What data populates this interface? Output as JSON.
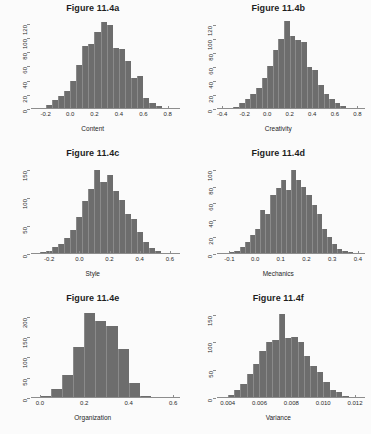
{
  "figure": {
    "background_color": "#fbfbfb",
    "bar_color": "#6d6d6d",
    "axis_color": "#8d8d8d",
    "layout": "2 columns x 3 rows grid of histograms"
  },
  "chart_data": [
    {
      "type": "bar",
      "title": "Figure 11.4a",
      "xlabel": "Content",
      "ylabel": "",
      "xticks": [
        "-0.2",
        "0.0",
        "0.2",
        "0.4",
        "0.6",
        "0.8"
      ],
      "xtick_values": [
        -0.2,
        0.0,
        0.2,
        0.4,
        0.6,
        0.8
      ],
      "yticks": [
        "0",
        "20",
        "40",
        "60",
        "80",
        "100",
        "120"
      ],
      "ytick_values": [
        0,
        20,
        40,
        60,
        80,
        100,
        120
      ],
      "xlim": [
        -0.32,
        0.88
      ],
      "ylim": [
        0,
        128
      ],
      "grid": false,
      "legend": "none",
      "bin_width": 0.05,
      "bin_starts": [
        -0.3,
        -0.25,
        -0.2,
        -0.15,
        -0.1,
        -0.05,
        0.0,
        0.05,
        0.1,
        0.15,
        0.2,
        0.25,
        0.3,
        0.35,
        0.4,
        0.45,
        0.5,
        0.55,
        0.6,
        0.65,
        0.7,
        0.75,
        0.8
      ],
      "values": [
        1,
        2,
        5,
        12,
        18,
        26,
        40,
        62,
        88,
        92,
        108,
        122,
        118,
        86,
        84,
        68,
        44,
        46,
        16,
        8,
        4,
        2,
        1
      ]
    },
    {
      "type": "bar",
      "title": "Figure 11.4b",
      "xlabel": "Creativity",
      "ylabel": "",
      "xticks": [
        "-0.4",
        "-0.2",
        "0.0",
        "0.2",
        "0.4",
        "0.6",
        "0.8"
      ],
      "xtick_values": [
        -0.4,
        -0.2,
        0.0,
        0.2,
        0.4,
        0.6,
        0.8
      ],
      "yticks": [
        "0",
        "20",
        "40",
        "60",
        "80",
        "100",
        "120"
      ],
      "ytick_values": [
        0,
        20,
        40,
        60,
        80,
        100,
        120
      ],
      "xlim": [
        -0.45,
        0.85
      ],
      "ylim": [
        0,
        130
      ],
      "grid": false,
      "legend": "none",
      "bin_width": 0.05,
      "bin_starts": [
        -0.4,
        -0.35,
        -0.3,
        -0.25,
        -0.2,
        -0.15,
        -0.1,
        -0.05,
        0.0,
        0.05,
        0.1,
        0.15,
        0.2,
        0.25,
        0.3,
        0.35,
        0.4,
        0.45,
        0.5,
        0.55,
        0.6,
        0.65,
        0.7,
        0.75,
        0.8
      ],
      "values": [
        1,
        1,
        3,
        8,
        14,
        22,
        30,
        44,
        62,
        84,
        100,
        126,
        104,
        98,
        96,
        60,
        56,
        34,
        22,
        14,
        8,
        4,
        2,
        1,
        1
      ]
    },
    {
      "type": "bar",
      "title": "Figure 11.4c",
      "xlabel": "Style",
      "ylabel": "",
      "xticks": [
        "-0.2",
        "0.0",
        "0.2",
        "0.4",
        "0.6"
      ],
      "xtick_values": [
        -0.2,
        0.0,
        0.2,
        0.4,
        0.6
      ],
      "yticks": [
        "0",
        "50",
        "100",
        "150"
      ],
      "ytick_values": [
        0,
        50,
        100,
        150
      ],
      "xlim": [
        -0.32,
        0.65
      ],
      "ylim": [
        0,
        162
      ],
      "grid": false,
      "legend": "none",
      "bin_width": 0.04,
      "bin_starts": [
        -0.3,
        -0.26,
        -0.22,
        -0.18,
        -0.14,
        -0.1,
        -0.06,
        -0.02,
        0.02,
        0.06,
        0.1,
        0.14,
        0.18,
        0.22,
        0.26,
        0.3,
        0.34,
        0.38,
        0.42,
        0.46,
        0.5,
        0.54,
        0.58
      ],
      "values": [
        2,
        4,
        6,
        12,
        18,
        28,
        42,
        66,
        94,
        116,
        150,
        128,
        140,
        112,
        96,
        72,
        62,
        40,
        22,
        10,
        5,
        2,
        1
      ]
    },
    {
      "type": "bar",
      "title": "Figure 11.4d",
      "xlabel": "Mechanics",
      "ylabel": "",
      "xticks": [
        "-0.1",
        "0.0",
        "0.1",
        "0.2",
        "0.3",
        "0.4"
      ],
      "xtick_values": [
        -0.1,
        0.0,
        0.1,
        0.2,
        0.3,
        0.4
      ],
      "yticks": [
        "0",
        "20",
        "40",
        "60",
        "80",
        "100"
      ],
      "ytick_values": [
        0,
        20,
        40,
        60,
        80,
        100
      ],
      "xlim": [
        -0.15,
        0.42
      ],
      "ylim": [
        0,
        108
      ],
      "grid": false,
      "legend": "none",
      "bin_width": 0.02,
      "bin_starts": [
        -0.14,
        -0.12,
        -0.1,
        -0.08,
        -0.06,
        -0.04,
        -0.02,
        0.0,
        0.02,
        0.04,
        0.06,
        0.08,
        0.1,
        0.12,
        0.14,
        0.16,
        0.18,
        0.2,
        0.22,
        0.24,
        0.26,
        0.28,
        0.3,
        0.32,
        0.34,
        0.36,
        0.38
      ],
      "values": [
        1,
        1,
        2,
        4,
        8,
        14,
        22,
        30,
        52,
        48,
        70,
        78,
        88,
        76,
        100,
        88,
        80,
        70,
        58,
        48,
        30,
        20,
        12,
        6,
        3,
        2,
        1
      ]
    },
    {
      "type": "bar",
      "title": "Figure 11.4e",
      "xlabel": "Organization",
      "ylabel": "",
      "xticks": [
        "0.0",
        "0.2",
        "0.4",
        "0.6"
      ],
      "xtick_values": [
        0.0,
        0.2,
        0.4,
        0.6
      ],
      "yticks": [
        "0",
        "50",
        "100",
        "150",
        "200"
      ],
      "ytick_values": [
        0,
        50,
        100,
        150,
        200
      ],
      "xlim": [
        -0.04,
        0.62
      ],
      "ylim": [
        0,
        222
      ],
      "grid": false,
      "legend": "none",
      "bin_width": 0.05,
      "bin_starts": [
        0.0,
        0.05,
        0.1,
        0.15,
        0.2,
        0.25,
        0.3,
        0.35,
        0.4,
        0.45,
        0.5,
        0.55
      ],
      "values": [
        6,
        22,
        56,
        126,
        210,
        190,
        178,
        122,
        38,
        6,
        3,
        1
      ]
    },
    {
      "type": "bar",
      "title": "Figure 11.4f",
      "xlabel": "Variance",
      "ylabel": "",
      "xticks": [
        "0.004",
        "0.006",
        "0.008",
        "0.010",
        "0.012"
      ],
      "xtick_values": [
        0.004,
        0.006,
        0.008,
        0.01,
        0.012
      ],
      "yticks": [
        "0",
        "50",
        "100",
        "150"
      ],
      "ytick_values": [
        0,
        50,
        100,
        150
      ],
      "xlim": [
        0.0033,
        0.0125
      ],
      "ylim": [
        0,
        162
      ],
      "grid": false,
      "legend": "none",
      "bin_width": 0.0004,
      "bin_starts": [
        0.0036,
        0.004,
        0.0044,
        0.0048,
        0.0052,
        0.0056,
        0.006,
        0.0064,
        0.0068,
        0.0072,
        0.0076,
        0.008,
        0.0084,
        0.0088,
        0.0092,
        0.0096,
        0.01,
        0.0104,
        0.0108,
        0.0112,
        0.0116,
        0.012
      ],
      "values": [
        2,
        6,
        14,
        26,
        44,
        62,
        84,
        100,
        104,
        152,
        108,
        110,
        100,
        76,
        58,
        46,
        28,
        14,
        10,
        4,
        2,
        1
      ]
    }
  ]
}
